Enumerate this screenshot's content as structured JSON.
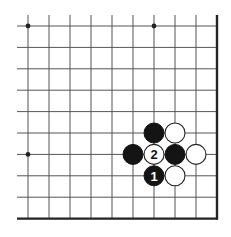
{
  "diagram": {
    "type": "go-board-fragment",
    "board_corner": "bottom-right",
    "grid": {
      "columns": 10,
      "rows": 10,
      "origin_x": 28,
      "origin_y": 26,
      "spacing_x": 21,
      "spacing_y": 21.4,
      "open_left_extent": 17,
      "open_top_extent": 15
    },
    "colors": {
      "line": "#555555",
      "edge": "#222222",
      "black_stone": "#141414",
      "white_stone": "#ffffff"
    },
    "star_points": [
      {
        "col": 0,
        "row": 0
      },
      {
        "col": 6,
        "row": 0
      },
      {
        "col": 0,
        "row": 6
      }
    ],
    "stones": [
      {
        "color": "black",
        "col": 6,
        "row": 5,
        "label": ""
      },
      {
        "color": "white",
        "col": 7,
        "row": 5,
        "label": ""
      },
      {
        "color": "black",
        "col": 5,
        "row": 6,
        "label": ""
      },
      {
        "color": "white",
        "col": 6,
        "row": 6,
        "label": "2"
      },
      {
        "color": "black",
        "col": 7,
        "row": 6,
        "label": ""
      },
      {
        "color": "white",
        "col": 8,
        "row": 6,
        "label": ""
      },
      {
        "color": "black",
        "col": 6,
        "row": 7,
        "label": "1"
      },
      {
        "color": "white",
        "col": 7,
        "row": 7,
        "label": ""
      }
    ]
  }
}
